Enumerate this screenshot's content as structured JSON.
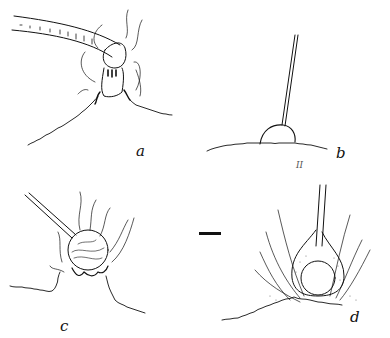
{
  "figure": {
    "panels": [
      {
        "id": "a",
        "label": "a",
        "description": "Stylet inserted obliquely through tuft of hairs into cell with cap-like sheath"
      },
      {
        "id": "b",
        "label": "b",
        "description": "Straight stylet inserted vertically into small hemispherical swelling on surface"
      },
      {
        "id": "c",
        "label": "c",
        "description": "Oblique stylet into globular swelling surrounded by hairs"
      },
      {
        "id": "d",
        "label": "d",
        "description": "Vertical stylet in flask-shaped stippled sheath surrounding globular body amid hairs"
      }
    ],
    "mark": "II",
    "scale_bar": {
      "visible": true
    }
  },
  "colors": {
    "ink": "#111111",
    "background": "#ffffff"
  }
}
